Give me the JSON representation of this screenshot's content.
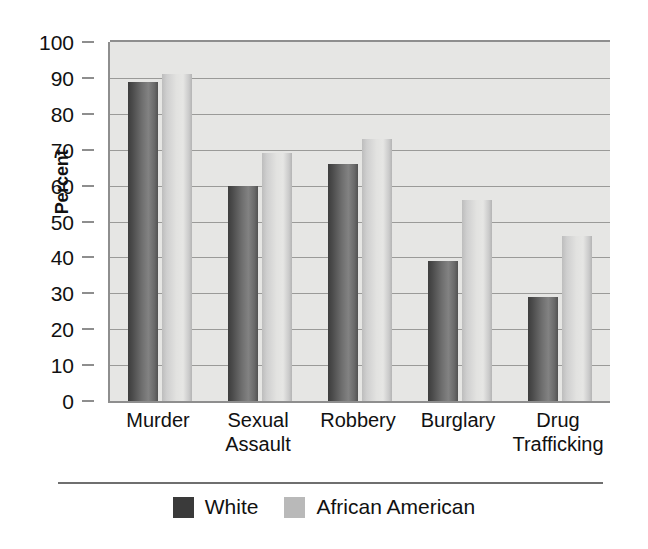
{
  "chart_data": {
    "type": "bar",
    "title": "",
    "xlabel": "",
    "ylabel": "Percent",
    "ylim": [
      0,
      100
    ],
    "ytick_step": 10,
    "yticks": [
      100,
      90,
      80,
      70,
      60,
      50,
      40,
      30,
      20,
      10,
      0
    ],
    "grid": true,
    "legend_position": "bottom",
    "categories": [
      "Murder",
      "Sexual Assault",
      "Robbery",
      "Burglary",
      "Drug Trafficking"
    ],
    "category_lines": [
      [
        "Murder"
      ],
      [
        "Sexual",
        "Assault"
      ],
      [
        "Robbery"
      ],
      [
        "Burglary"
      ],
      [
        "Drug",
        "Trafficking"
      ]
    ],
    "series": [
      {
        "name": "White",
        "color": "#5a5a5a",
        "values": [
          89,
          60,
          66,
          39,
          29
        ]
      },
      {
        "name": "African American",
        "color": "#d2d2d0",
        "values": [
          91,
          69,
          73,
          56,
          46
        ]
      }
    ]
  },
  "legend": {
    "items": [
      {
        "label": "White",
        "swatch": "white-series"
      },
      {
        "label": "African American",
        "swatch": "aa-series"
      }
    ]
  }
}
